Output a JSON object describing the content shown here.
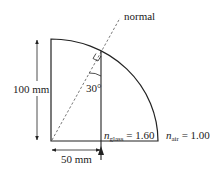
{
  "diagram": {
    "labels": {
      "normal": "normal",
      "height": "100 mm",
      "width": "50 mm",
      "angle": "30°",
      "n_glass_var": "n",
      "n_glass_sub": "glass",
      "n_glass_val": " = 1.60",
      "n_air_var": "n",
      "n_air_sub": "air",
      "n_air_val": " = 1.00"
    },
    "colors": {
      "stroke": "#222222",
      "dashed": "#555555",
      "background": "#ffffff"
    }
  }
}
